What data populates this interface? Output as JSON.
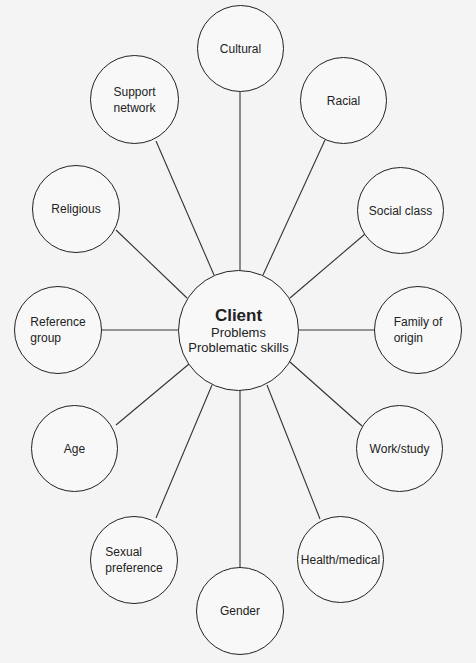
{
  "diagram": {
    "center": {
      "title": "Client",
      "lines": [
        "Problems",
        "Problematic skills"
      ]
    },
    "nodes": [
      {
        "id": "cultural",
        "label": "Cultural"
      },
      {
        "id": "racial",
        "label": "Racial"
      },
      {
        "id": "social-class",
        "label": "Social class"
      },
      {
        "id": "family-of-origin",
        "label": "Family of\norigin"
      },
      {
        "id": "work-study",
        "label": "Work/study"
      },
      {
        "id": "health-medical",
        "label": "Health/medical"
      },
      {
        "id": "gender",
        "label": "Gender"
      },
      {
        "id": "sexual-preference",
        "label": "Sexual\npreference"
      },
      {
        "id": "age",
        "label": "Age"
      },
      {
        "id": "reference-group",
        "label": "Reference\ngroup"
      },
      {
        "id": "religious",
        "label": "Religious"
      },
      {
        "id": "support-network",
        "label": "Support\nnetwork"
      }
    ]
  }
}
